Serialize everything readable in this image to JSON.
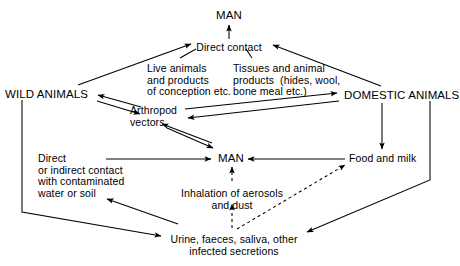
{
  "diagram": {
    "background_color": "#ffffff",
    "line_color": "#000000",
    "nodes": [
      {
        "id": "man_top",
        "label": "MAN",
        "x": 229,
        "y": 10,
        "style": "caps",
        "align": "center"
      },
      {
        "id": "direct_contact",
        "label": "Direct contact",
        "x": 229,
        "y": 42,
        "style": "lc",
        "align": "center"
      },
      {
        "id": "live_animals",
        "label": "Live animals\nand products\nof conception etc.",
        "x": 147,
        "y": 63,
        "style": "lc",
        "align": "left"
      },
      {
        "id": "tissues_products",
        "label": "Tissues and animal\nproducts  (hides, wool,\nbone meal etc.)",
        "x": 233,
        "y": 63,
        "style": "lc",
        "align": "left"
      },
      {
        "id": "wild_animals",
        "label": "WILD ANIMALS",
        "x": 5,
        "y": 89,
        "style": "caps",
        "align": "left"
      },
      {
        "id": "domestic_animals",
        "label": "DOMESTIC ANIMALS",
        "x": 344,
        "y": 90,
        "style": "caps",
        "align": "left"
      },
      {
        "id": "arthropod_vectors",
        "label": "Arthropod\nvectors",
        "x": 130,
        "y": 105,
        "style": "lc",
        "align": "left"
      },
      {
        "id": "man_center",
        "label": "MAN",
        "x": 218,
        "y": 153,
        "style": "caps",
        "align": "left"
      },
      {
        "id": "food_and_milk",
        "label": "Food and milk",
        "x": 349,
        "y": 153,
        "style": "lc",
        "align": "left"
      },
      {
        "id": "water_or_soil",
        "label": "Direct\nor indirect contact\nwith contaminated\nwater or soil",
        "x": 38,
        "y": 153,
        "style": "lc",
        "align": "left"
      },
      {
        "id": "inhalation",
        "label": "Inhalation of aerosols\nand dust",
        "x": 232,
        "y": 188,
        "style": "lc",
        "align": "center"
      },
      {
        "id": "secretions",
        "label": "Urine, faeces, saliva, other\ninfected secretions",
        "x": 234,
        "y": 234,
        "style": "lc",
        "align": "center"
      }
    ],
    "edges": [
      {
        "id": "direct-contact-to-man",
        "from": "direct_contact",
        "to": "man_top",
        "kind": "solid",
        "arrow": "end"
      },
      {
        "id": "wild-animals-to-direct-contact",
        "from": "wild_animals",
        "to": "direct_contact",
        "kind": "solid",
        "arrow": "end"
      },
      {
        "id": "domestic-animals-to-direct-contact",
        "from": "domestic_animals",
        "to": "direct_contact",
        "kind": "solid",
        "arrow": "end"
      },
      {
        "id": "live-animals-leader",
        "from": "live_animals",
        "to": "direct_contact",
        "kind": "leader",
        "arrow": "none"
      },
      {
        "id": "tissues-products-leader",
        "from": "tissues_products",
        "to": "direct_contact",
        "kind": "leader",
        "arrow": "none"
      },
      {
        "id": "wild-animals-to-arthropod",
        "from": "wild_animals",
        "to": "arthropod_vectors",
        "kind": "solid",
        "arrow": "end"
      },
      {
        "id": "arthropod-to-wild-animals",
        "from": "arthropod_vectors",
        "to": "wild_animals",
        "kind": "solid",
        "arrow": "end"
      },
      {
        "id": "arthropod-to-domestic-animals",
        "from": "arthropod_vectors",
        "to": "domestic_animals",
        "kind": "solid",
        "arrow": "end"
      },
      {
        "id": "domestic-animals-to-arthropod",
        "from": "domestic_animals",
        "to": "arthropod_vectors",
        "kind": "solid",
        "arrow": "end"
      },
      {
        "id": "arthropod-to-man",
        "from": "arthropod_vectors",
        "to": "man_center",
        "kind": "solid",
        "arrow": "end"
      },
      {
        "id": "man-to-arthropod",
        "from": "man_center",
        "to": "arthropod_vectors",
        "kind": "solid",
        "arrow": "end"
      },
      {
        "id": "water-or-soil-to-man",
        "from": "water_or_soil",
        "to": "man_center",
        "kind": "solid",
        "arrow": "end"
      },
      {
        "id": "food-and-milk-to-man",
        "from": "food_and_milk",
        "to": "man_center",
        "kind": "solid",
        "arrow": "end"
      },
      {
        "id": "domestic-animals-to-food",
        "from": "domestic_animals",
        "to": "food_and_milk",
        "kind": "solid",
        "arrow": "end"
      },
      {
        "id": "inhalation-to-man",
        "from": "inhalation",
        "to": "man_center",
        "kind": "dashed",
        "arrow": "end"
      },
      {
        "id": "secretions-to-inhalation",
        "from": "secretions",
        "to": "inhalation",
        "kind": "dashed",
        "arrow": "end"
      },
      {
        "id": "secretions-to-food-and-milk",
        "from": "secretions",
        "to": "food_and_milk",
        "kind": "dashed",
        "arrow": "end"
      },
      {
        "id": "wild-animals-to-secretions",
        "from": "wild_animals",
        "to": "secretions",
        "kind": "solid",
        "arrow": "end"
      },
      {
        "id": "domestic-animals-to-secretions",
        "from": "domestic_animals",
        "to": "secretions",
        "kind": "solid",
        "arrow": "end"
      },
      {
        "id": "secretions-to-water-or-soil",
        "from": "secretions",
        "to": "water_or_soil",
        "kind": "solid",
        "arrow": "end"
      }
    ]
  }
}
